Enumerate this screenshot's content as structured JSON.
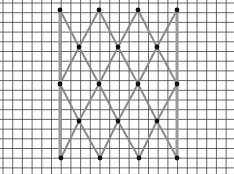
{
  "figure": {
    "type": "lattice-on-grid-paper",
    "width": 234,
    "height": 174,
    "grid": {
      "spacing": 9.7,
      "origin_x": 3,
      "origin_y": 3,
      "line_color": "#3a3a3a",
      "background": "#ffffff"
    },
    "colors": {
      "edge": "#8a8a8a",
      "bar": "#9a9a9a",
      "dot": "#111111"
    },
    "vertical_bars": [
      {
        "x": 60,
        "y1": 10,
        "y2": 158
      },
      {
        "x": 177,
        "y1": 10,
        "y2": 158
      }
    ],
    "dots": [
      {
        "x": 60,
        "y": 10
      },
      {
        "x": 99,
        "y": 10
      },
      {
        "x": 138,
        "y": 10
      },
      {
        "x": 177,
        "y": 10
      },
      {
        "x": 79,
        "y": 47
      },
      {
        "x": 118,
        "y": 47
      },
      {
        "x": 157,
        "y": 47
      },
      {
        "x": 60,
        "y": 84
      },
      {
        "x": 99,
        "y": 84
      },
      {
        "x": 138,
        "y": 84
      },
      {
        "x": 177,
        "y": 84
      },
      {
        "x": 79,
        "y": 121
      },
      {
        "x": 118,
        "y": 121
      },
      {
        "x": 157,
        "y": 121
      },
      {
        "x": 61,
        "y": 158
      },
      {
        "x": 100,
        "y": 158
      },
      {
        "x": 139,
        "y": 158
      },
      {
        "x": 177,
        "y": 158
      }
    ],
    "edges": [
      [
        60,
        10,
        79,
        47
      ],
      [
        99,
        10,
        79,
        47
      ],
      [
        99,
        10,
        118,
        47
      ],
      [
        138,
        10,
        118,
        47
      ],
      [
        138,
        10,
        157,
        47
      ],
      [
        177,
        10,
        157,
        47
      ],
      [
        79,
        47,
        60,
        84
      ],
      [
        79,
        47,
        99,
        84
      ],
      [
        118,
        47,
        99,
        84
      ],
      [
        118,
        47,
        138,
        84
      ],
      [
        157,
        47,
        138,
        84
      ],
      [
        157,
        47,
        177,
        84
      ],
      [
        60,
        84,
        79,
        121
      ],
      [
        99,
        84,
        79,
        121
      ],
      [
        99,
        84,
        118,
        121
      ],
      [
        138,
        84,
        118,
        121
      ],
      [
        138,
        84,
        157,
        121
      ],
      [
        177,
        84,
        157,
        121
      ],
      [
        79,
        121,
        61,
        158
      ],
      [
        79,
        121,
        100,
        158
      ],
      [
        118,
        121,
        100,
        158
      ],
      [
        118,
        121,
        139,
        158
      ],
      [
        157,
        121,
        139,
        158
      ],
      [
        157,
        121,
        177,
        158
      ]
    ]
  }
}
